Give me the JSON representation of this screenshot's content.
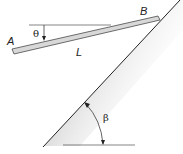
{
  "diagram": {
    "labels": {
      "point_a": "A",
      "point_b": "B",
      "length": "L",
      "theta": "θ",
      "beta": "β"
    },
    "colors": {
      "line": "#222222",
      "rod_fill": "#d8d8d8",
      "wall_shade": "#bdbdbd"
    }
  }
}
